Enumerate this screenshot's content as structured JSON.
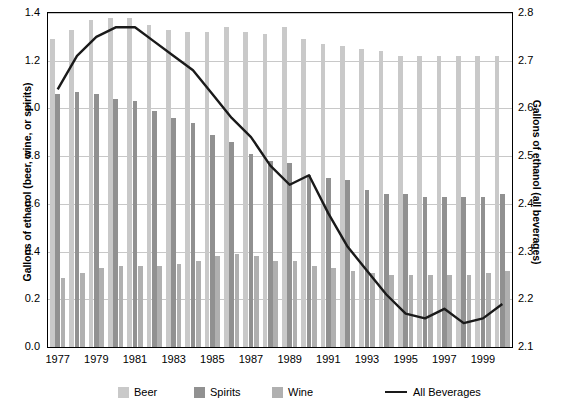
{
  "chart_data": {
    "type": "bar",
    "title": "",
    "subtitle": "",
    "xlabel": "",
    "ylabel": "Gallons of ethanol (beer, wine, or spirits)",
    "ylabel_right": "Gallons of ethanol (all beverages)",
    "ylim": [
      0.0,
      1.4
    ],
    "ylim_right": [
      2.1,
      2.8
    ],
    "yticks": [
      "0.0",
      "0.2",
      "0.4",
      "0.6",
      "0.8",
      "1.0",
      "1.2",
      "1.4"
    ],
    "ytick_values": [
      0.0,
      0.2,
      0.4,
      0.6,
      0.8,
      1.0,
      1.2,
      1.4
    ],
    "yticks_right": [
      "2.1",
      "2.2",
      "2.3",
      "2.4",
      "2.5",
      "2.6",
      "2.7",
      "2.8"
    ],
    "ytick_values_right": [
      2.1,
      2.2,
      2.3,
      2.4,
      2.5,
      2.6,
      2.7,
      2.8
    ],
    "grid": true,
    "legend_position": "bottom",
    "categories": [
      1977,
      1978,
      1979,
      1980,
      1981,
      1982,
      1983,
      1984,
      1985,
      1986,
      1987,
      1988,
      1989,
      1990,
      1991,
      1992,
      1993,
      1994,
      1995,
      1996,
      1997,
      1998,
      1999,
      2000
    ],
    "xtick_labels": [
      "1977",
      "1979",
      "1981",
      "1983",
      "1985",
      "1987",
      "1989",
      "1991",
      "1993",
      "1995",
      "1997",
      "1999"
    ],
    "series": [
      {
        "name": "Beer",
        "axis": "left",
        "color": "#c9c9c9",
        "values": [
          1.29,
          1.33,
          1.37,
          1.38,
          1.38,
          1.35,
          1.33,
          1.32,
          1.32,
          1.34,
          1.32,
          1.31,
          1.34,
          1.29,
          1.27,
          1.26,
          1.25,
          1.24,
          1.22,
          1.22,
          1.22,
          1.22,
          1.22,
          1.22
        ]
      },
      {
        "name": "Spirits",
        "axis": "left",
        "color": "#919191",
        "values": [
          1.06,
          1.07,
          1.06,
          1.04,
          1.03,
          0.99,
          0.96,
          0.94,
          0.89,
          0.86,
          0.81,
          0.78,
          0.77,
          0.72,
          0.71,
          0.7,
          0.66,
          0.64,
          0.64,
          0.63,
          0.63,
          0.63,
          0.63,
          0.64
        ]
      },
      {
        "name": "Wine",
        "axis": "left",
        "color": "#b0b0b0",
        "values": [
          0.29,
          0.31,
          0.33,
          0.34,
          0.34,
          0.34,
          0.35,
          0.36,
          0.38,
          0.39,
          0.38,
          0.36,
          0.36,
          0.34,
          0.33,
          0.32,
          0.31,
          0.3,
          0.3,
          0.3,
          0.3,
          0.3,
          0.31,
          0.32
        ]
      },
      {
        "name": "All Beverages",
        "type": "line",
        "axis": "right",
        "color": "#1a1a1a",
        "values": [
          2.64,
          2.71,
          2.75,
          2.77,
          2.77,
          2.74,
          2.71,
          2.68,
          2.63,
          2.58,
          2.54,
          2.48,
          2.44,
          2.46,
          2.38,
          2.31,
          2.26,
          2.21,
          2.17,
          2.16,
          2.18,
          2.15,
          2.16,
          2.19
        ]
      }
    ]
  },
  "legend": {
    "items": [
      {
        "label": "Beer",
        "kind": "swatch",
        "swatch": "beer"
      },
      {
        "label": "Spirits",
        "kind": "swatch",
        "swatch": "spirits"
      },
      {
        "label": "Wine",
        "kind": "swatch",
        "swatch": "wine"
      },
      {
        "label": "All Beverages",
        "kind": "line",
        "swatch": "line"
      }
    ]
  },
  "colors": {
    "beer": "#c9c9c9",
    "spirits": "#919191",
    "wine": "#b0b0b0",
    "line": "#1a1a1a",
    "grid": "#c8c8c8",
    "axis": "#000000"
  }
}
